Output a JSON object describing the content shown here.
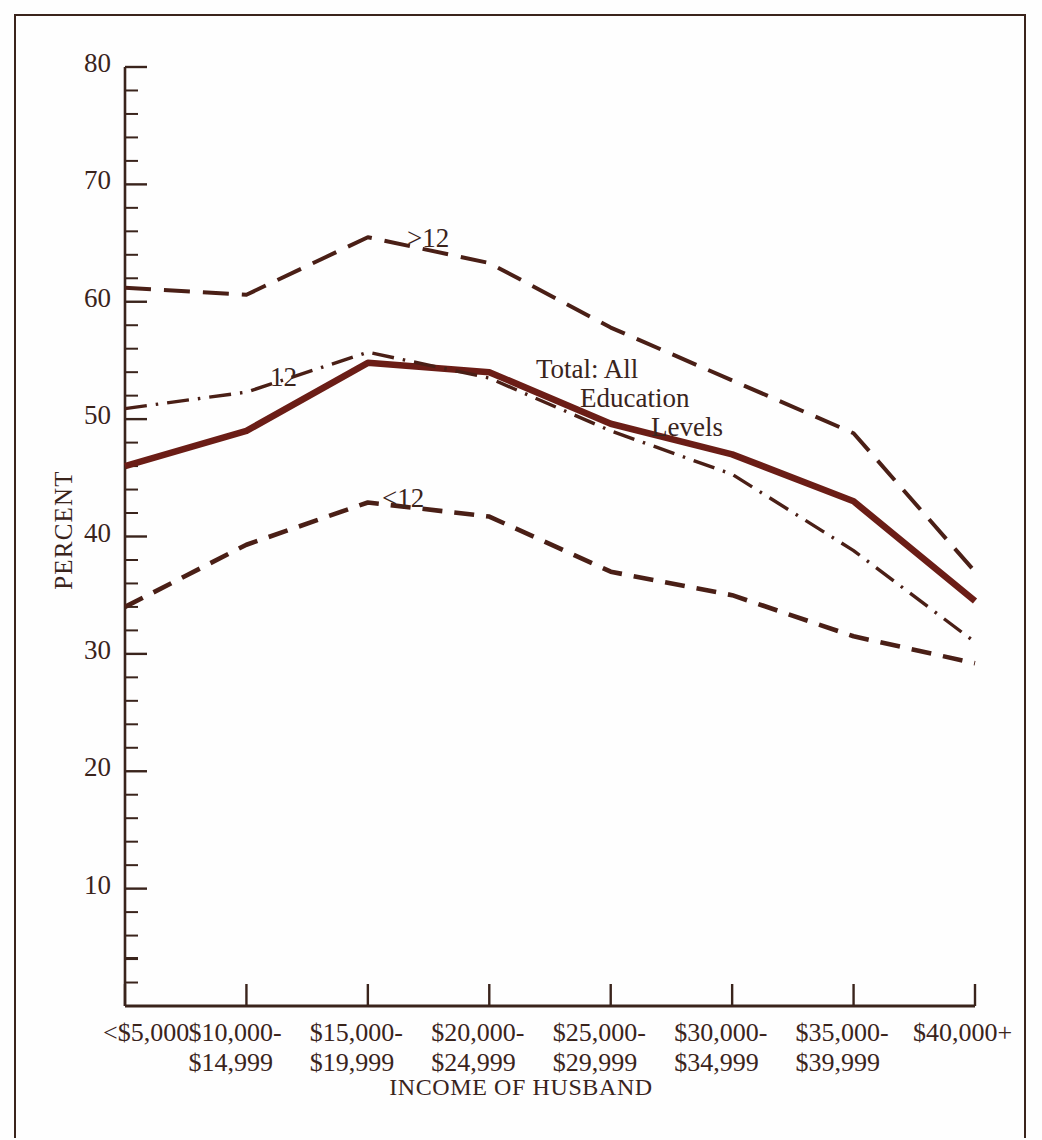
{
  "chart_data": {
    "type": "line",
    "title": "",
    "xlabel": "INCOME OF HUSBAND",
    "ylabel": "PERCENT",
    "ylim": [
      0,
      80
    ],
    "ytick_step": 10,
    "yminor_step": 2,
    "grid": false,
    "legend": "inline-labels",
    "categories": [
      "<$5,000",
      "$10,000-\n$14,999",
      "$15,000-\n$19,999",
      "$20,000-\n$24,999",
      "$25,000-\n$29,999",
      "$30,000-\n$34,999",
      "$35,000-\n$39,999",
      "$40,000+"
    ],
    "ytick_labels": [
      "10",
      "20",
      "30",
      "40",
      "50",
      "60",
      "70",
      "80"
    ],
    "ytick_values": [
      10,
      20,
      30,
      40,
      50,
      60,
      70,
      80
    ],
    "series": [
      {
        "name": ">12",
        "label": ">12",
        "style": "long-dash",
        "color": "#4a1f16",
        "values": [
          61.2,
          60.6,
          65.5,
          63.3,
          57.8,
          53.3,
          48.8,
          37.0
        ]
      },
      {
        "name": "Total: All Education Levels",
        "label": "Total: All\nEducation\nLevels",
        "style": "solid-thick",
        "color": "#6b1d16",
        "values": [
          46.0,
          49.0,
          54.8,
          54.0,
          49.6,
          47.0,
          43.0,
          34.5
        ]
      },
      {
        "name": "12",
        "label": "12",
        "style": "dash-dot",
        "color": "#4a1f16",
        "values": [
          50.9,
          52.3,
          55.7,
          53.5,
          49.0,
          45.3,
          38.8,
          31.0
        ]
      },
      {
        "name": "<12",
        "label": "<12",
        "style": "medium-dash",
        "color": "#4a1f16",
        "values": [
          34.0,
          39.3,
          42.9,
          41.7,
          37.0,
          35.0,
          31.5,
          29.2
        ]
      }
    ],
    "annotations": [
      {
        "text": ">12",
        "x_px": 407,
        "y_px": 223
      },
      {
        "text": "12",
        "x_px": 270,
        "y_px": 362
      },
      {
        "text": "<12",
        "x_px": 382,
        "y_px": 483
      },
      {
        "text": "Total: All",
        "x_px": 536,
        "y_px": 354
      },
      {
        "text": "Education",
        "x_px": 580,
        "y_px": 383
      },
      {
        "text": "Levels",
        "x_px": 651,
        "y_px": 412
      }
    ],
    "colors": {
      "axis": "#3a241c",
      "text": "#3a241c",
      "total_line": "#6b1d16",
      "other_lines": "#4a1f16",
      "background": "#fefefe",
      "frame": "#3a241c"
    }
  }
}
